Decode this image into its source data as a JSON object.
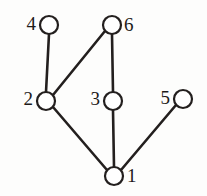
{
  "figure": {
    "background_color": "#fdfdfc",
    "stroke_color": "#231f1e",
    "node_fill_color": "#ffffff",
    "width": 207,
    "height": 196
  },
  "graph": {
    "type": "undirected-graph",
    "node_radius": 9,
    "nodes": [
      {
        "id": "1",
        "label": "1",
        "cx": 114,
        "cy": 176,
        "label_x": 127,
        "label_y": 178,
        "label_side": "right"
      },
      {
        "id": "2",
        "label": "2",
        "cx": 46,
        "cy": 101,
        "label_x": 33,
        "label_y": 101,
        "label_side": "left"
      },
      {
        "id": "3",
        "label": "3",
        "cx": 113,
        "cy": 101,
        "label_x": 100,
        "label_y": 101,
        "label_side": "left"
      },
      {
        "id": "4",
        "label": "4",
        "cx": 49,
        "cy": 25,
        "label_x": 36,
        "label_y": 26,
        "label_side": "left"
      },
      {
        "id": "5",
        "label": "5",
        "cx": 183,
        "cy": 99,
        "label_x": 170,
        "label_y": 100,
        "label_side": "left"
      },
      {
        "id": "6",
        "label": "6",
        "cx": 112,
        "cy": 25,
        "label_x": 124,
        "label_y": 27,
        "label_side": "right"
      }
    ],
    "edges": [
      {
        "from": "4",
        "to": "2",
        "x1": 49,
        "y1": 34,
        "x2": 46,
        "y2": 92
      },
      {
        "from": "6",
        "to": "2",
        "x1": 105,
        "y1": 31,
        "x2": 53,
        "y2": 95
      },
      {
        "from": "6",
        "to": "3",
        "x1": 112,
        "y1": 34,
        "x2": 113,
        "y2": 92
      },
      {
        "from": "3",
        "to": "1",
        "x1": 113,
        "y1": 110,
        "x2": 114,
        "y2": 167
      },
      {
        "from": "2",
        "to": "1",
        "x1": 53,
        "y1": 107,
        "x2": 107,
        "y2": 170
      },
      {
        "from": "5",
        "to": "1",
        "x1": 176,
        "y1": 105,
        "x2": 121,
        "y2": 170
      }
    ]
  }
}
